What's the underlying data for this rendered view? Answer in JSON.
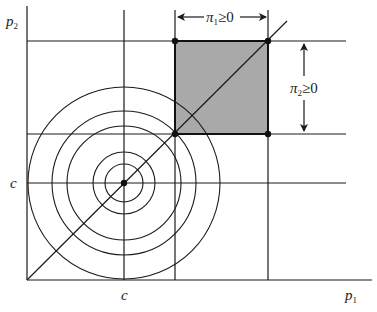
{
  "figure": {
    "axes": {
      "x_label": "p",
      "x_label_sub": "1",
      "y_label": "p",
      "y_label_sub": "2"
    },
    "tick_labels": {
      "x_c": "c",
      "y_c": "c"
    },
    "annotations": {
      "pi1": {
        "sym": "π",
        "sub": "1",
        "rel": "≥0"
      },
      "pi2": {
        "sym": "π",
        "sub": "2",
        "rel": "≥0"
      }
    },
    "colors": {
      "line": "#1a1a1a",
      "shaded_region": "#a9a9a9",
      "background": "#ffffff"
    },
    "circles": {
      "center": [
        124,
        183
      ],
      "radii": [
        19,
        31,
        57,
        72,
        96
      ]
    }
  }
}
